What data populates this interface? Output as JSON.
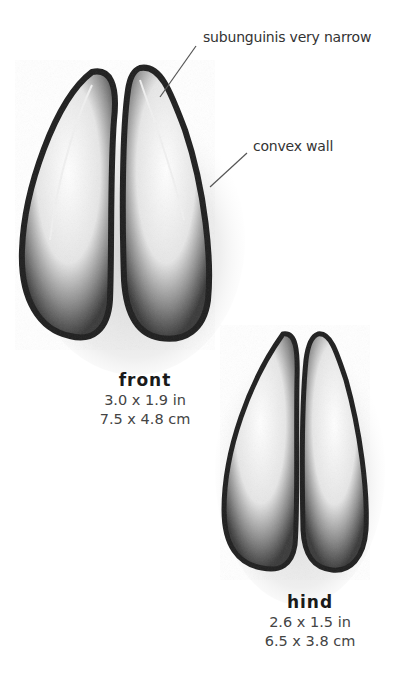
{
  "annotations": [
    {
      "id": "subunguinis",
      "text": "subunguinis very narrow"
    },
    {
      "id": "convex-wall",
      "text": "convex wall"
    }
  ],
  "tracks": {
    "front": {
      "title": "front",
      "size_in": "3.0 x 1.9 in",
      "size_cm": "7.5 x 4.8 cm"
    },
    "hind": {
      "title": "hind",
      "size_in": "2.6 x 1.5 in",
      "size_cm": "6.5 x 3.8 cm"
    }
  },
  "colors": {
    "ink": "#1e1e1e",
    "shade": "#6b6b6b",
    "paper": "#ffffff",
    "text": "#3a3a3a"
  }
}
